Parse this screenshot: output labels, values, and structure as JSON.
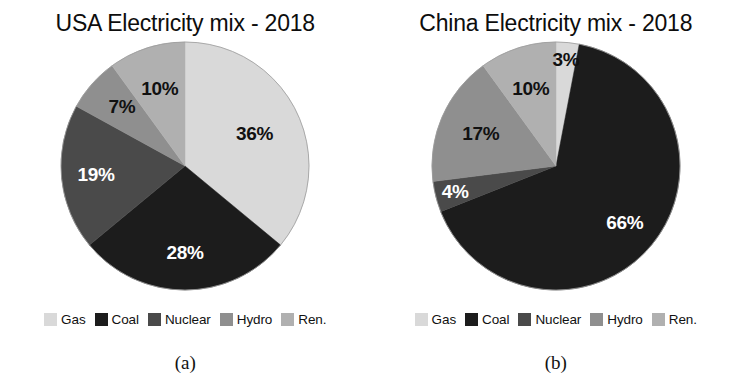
{
  "figure": {
    "background": "#ffffff",
    "panels": [
      {
        "title": "USA Electricity mix - 2018",
        "caption": "(a)",
        "legend_label_gas": "Gas",
        "legend_label_coal": "Coal",
        "legend_label_nuclear": "Nuclear",
        "legend_label_hydro": "Hydro",
        "legend_label_ren": "Ren.",
        "labels": {
          "gas": "36%",
          "coal": "28%",
          "nuclear": "19%",
          "hydro": "7%",
          "ren": "10%"
        }
      },
      {
        "title": "China Electricity mix - 2018",
        "caption": "(b)",
        "legend_label_gas": "Gas",
        "legend_label_coal": "Coal",
        "legend_label_nuclear": "Nuclear",
        "legend_label_hydro": "Hydro",
        "legend_label_ren": "Ren.",
        "labels": {
          "gas": "3%",
          "coal": "66%",
          "nuclear": "4%",
          "hydro": "17%",
          "ren": "10%"
        }
      }
    ]
  },
  "colors": {
    "gas": "#d9d9d9",
    "coal": "#1c1c1c",
    "nuclear": "#4a4a4a",
    "hydro": "#8f8f8f",
    "ren": "#b0b0b0",
    "label_light": "#ffffff",
    "label_dark": "#111111",
    "outline": "#9a9a9a"
  },
  "chart_data": [
    {
      "type": "pie",
      "title": "USA Electricity mix - 2018",
      "subtitle": "(a)",
      "categories": [
        "Gas",
        "Coal",
        "Nuclear",
        "Hydro",
        "Ren."
      ],
      "values": [
        36,
        28,
        19,
        7,
        10
      ],
      "value_labels": [
        "36%",
        "28%",
        "19%",
        "7%",
        "10%"
      ],
      "unit": "percent",
      "colors": [
        "#d9d9d9",
        "#1c1c1c",
        "#4a4a4a",
        "#8f8f8f",
        "#b0b0b0"
      ],
      "start_angle_deg": 0,
      "direction": "clockwise",
      "legend": [
        "Gas",
        "Coal",
        "Nuclear",
        "Hydro",
        "Ren."
      ],
      "legend_position": "bottom",
      "grid": false
    },
    {
      "type": "pie",
      "title": "China Electricity mix - 2018",
      "subtitle": "(b)",
      "categories": [
        "Gas",
        "Coal",
        "Nuclear",
        "Hydro",
        "Ren."
      ],
      "values": [
        3,
        66,
        4,
        17,
        10
      ],
      "value_labels": [
        "3%",
        "66%",
        "4%",
        "17%",
        "10%"
      ],
      "unit": "percent",
      "colors": [
        "#d9d9d9",
        "#1c1c1c",
        "#4a4a4a",
        "#8f8f8f",
        "#b0b0b0"
      ],
      "start_angle_deg": 0,
      "direction": "clockwise",
      "legend": [
        "Gas",
        "Coal",
        "Nuclear",
        "Hydro",
        "Ren."
      ],
      "legend_position": "bottom",
      "grid": false
    }
  ]
}
